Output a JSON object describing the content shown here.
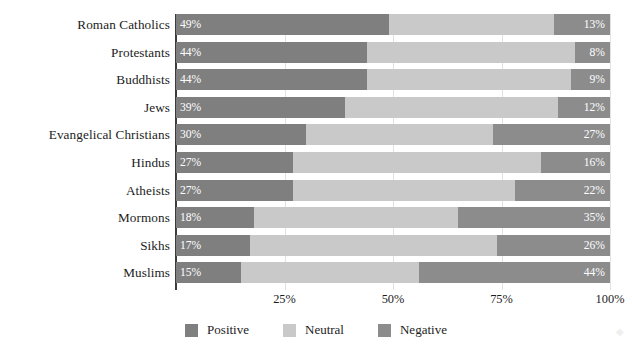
{
  "chart_data": {
    "type": "bar",
    "subtype": "stacked-horizontal-100pct",
    "title": "",
    "xlabel": "",
    "ylabel": "",
    "xlim": [
      0,
      100
    ],
    "xticks": [
      25,
      50,
      75,
      100
    ],
    "xtick_labels": [
      "25%",
      "50%",
      "75%",
      "100%"
    ],
    "grid": true,
    "grid_axis": "x",
    "legend_position": "bottom-center",
    "categories": [
      "Roman Catholics",
      "Protestants",
      "Buddhists",
      "Jews",
      "Evangelical Christians",
      "Hindus",
      "Atheists",
      "Mormons",
      "Sikhs",
      "Muslims"
    ],
    "series": [
      {
        "name": "Positive",
        "color": "#7f7f7f",
        "values": [
          49,
          44,
          44,
          39,
          30,
          27,
          27,
          18,
          17,
          15
        ],
        "value_labels": [
          "49%",
          "44%",
          "44%",
          "39%",
          "30%",
          "27%",
          "27%",
          "18%",
          "17%",
          "15%"
        ]
      },
      {
        "name": "Neutral",
        "color": "#c9c9c9",
        "values": [
          38,
          48,
          47,
          49,
          43,
          57,
          51,
          47,
          57,
          41
        ],
        "value_labels": [
          "",
          "",
          "",
          "",
          "",
          "",
          "",
          "",
          "",
          ""
        ]
      },
      {
        "name": "Negative",
        "color": "#8c8c8c",
        "values": [
          13,
          8,
          9,
          12,
          27,
          16,
          22,
          35,
          26,
          44
        ],
        "value_labels": [
          "13%",
          "8%",
          "9%",
          "12%",
          "27%",
          "16%",
          "22%",
          "35%",
          "26%",
          "44%"
        ]
      }
    ]
  },
  "legend": {
    "items": [
      {
        "label": "Positive",
        "color": "#7f7f7f"
      },
      {
        "label": "Neutral",
        "color": "#c9c9c9"
      },
      {
        "label": "Negative",
        "color": "#8c8c8c"
      }
    ]
  },
  "axis": {
    "tick_labels": [
      "25%",
      "50%",
      "75%",
      "100%"
    ]
  },
  "colors": {
    "positive": "#7f7f7f",
    "neutral": "#c9c9c9",
    "negative": "#8c8c8c",
    "axis": "#3c3c3c",
    "grid": "#e2e2e2",
    "text": "#1c1c1c",
    "value_text": "#ffffff",
    "background": "#ffffff"
  }
}
